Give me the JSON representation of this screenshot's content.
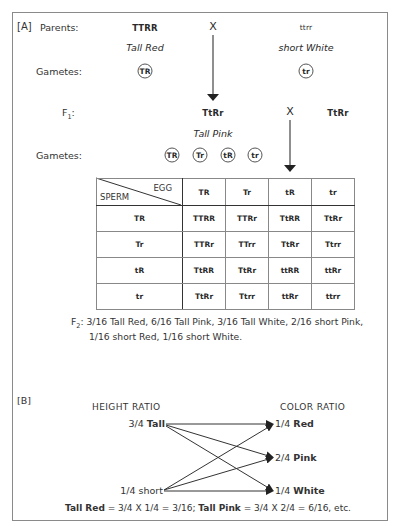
{
  "section_a": {
    "label": "[A]",
    "parents_label": "Parents:",
    "parent1": {
      "genotype": "TTRR",
      "phenotype": "Tall Red",
      "gamete": "TR"
    },
    "cross_symbol": "X",
    "parent2": {
      "genotype": "ttrr",
      "phenotype": "short White",
      "gamete": "tr"
    },
    "gametes_label": "Gametes:",
    "f1": {
      "label": "F",
      "label_sub": "1",
      "label_suffix": ":",
      "genotype_left": "TtRr",
      "cross_symbol": "X",
      "genotype_right": "TtRr",
      "phenotype": "Tall Pink",
      "gametes_label": "Gametes:",
      "gametes": [
        "TR",
        "Tr",
        "tR",
        "tr"
      ]
    },
    "punnett": {
      "corner_egg": "EGG",
      "corner_sperm": "SPERM",
      "egg_headers": [
        "TR",
        "Tr",
        "tR",
        "tr"
      ],
      "rows": [
        {
          "sperm": "TR",
          "cells": [
            "TTRR",
            "TTRr",
            "TtRR",
            "TtRr"
          ]
        },
        {
          "sperm": "Tr",
          "cells": [
            "TTRr",
            "TTrr",
            "TtRr",
            "Ttrr"
          ]
        },
        {
          "sperm": "tR",
          "cells": [
            "TtRR",
            "TtRr",
            "ttRR",
            "ttRr"
          ]
        },
        {
          "sperm": "tr",
          "cells": [
            "TtRr",
            "Ttrr",
            "ttRr",
            "ttrr"
          ]
        }
      ]
    },
    "f2": {
      "label": "F",
      "label_sub": "2",
      "label_suffix": ":",
      "line1": "3/16 Tall Red, 6/16 Tall Pink, 3/16 Tall White, 2/16 short Pink,",
      "line2": "1/16 short Red, 1/16 short White."
    }
  },
  "section_b": {
    "label": "[B]",
    "height_ratio_title": "HEIGHT RATIO",
    "color_ratio_title": "COLOR RATIO",
    "height": [
      {
        "fraction": "3/4",
        "trait": "Tall"
      },
      {
        "fraction": "1/4",
        "trait": "short"
      }
    ],
    "color": [
      {
        "fraction": "1/4",
        "trait": "Red"
      },
      {
        "fraction": "2/4",
        "trait": "Pink"
      },
      {
        "fraction": "1/4",
        "trait": "White"
      }
    ],
    "formula": {
      "term1_label": "Tall Red",
      "term1_expr": " = 3/4 X 1/4 = 3/16; ",
      "term2_label": "Tall Pink",
      "term2_expr": " = 3/4 X 2/4 = 6/16, etc."
    }
  }
}
